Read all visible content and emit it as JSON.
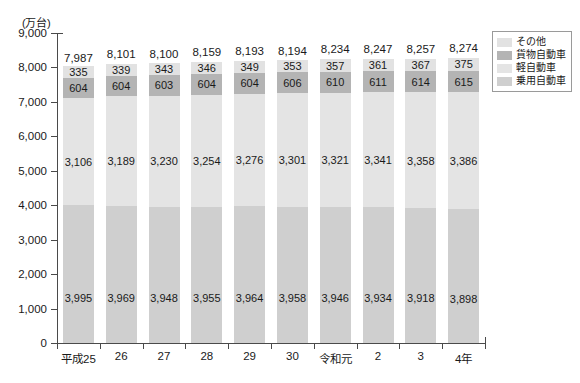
{
  "chart_data": {
    "type": "bar",
    "subtype": "stacked-bar",
    "title": "",
    "unit_label": "(万台)",
    "xlabel": "",
    "ylabel": "",
    "ylim": [
      0,
      9000
    ],
    "ytick_step": 1000,
    "ytick_labels": [
      "9,000",
      "8,000",
      "7,000",
      "6,000",
      "5,000",
      "4,000",
      "3,000",
      "2,000",
      "1,000",
      "0"
    ],
    "ytick_values": [
      9000,
      8000,
      7000,
      6000,
      5000,
      4000,
      3000,
      2000,
      1000,
      0
    ],
    "grid": false,
    "legend_position": "top-right",
    "categories": [
      "平成25",
      "26",
      "27",
      "28",
      "29",
      "30",
      "令和元",
      "2",
      "3",
      "4年"
    ],
    "series": [
      {
        "name": "乗用自動車",
        "color": "#cfcfcf",
        "values": [
          3995,
          3969,
          3948,
          3955,
          3964,
          3958,
          3946,
          3934,
          3918,
          3898
        ],
        "labels": [
          "3,995",
          "3,969",
          "3,948",
          "3,955",
          "3,964",
          "3,958",
          "3,946",
          "3,934",
          "3,918",
          "3,898"
        ]
      },
      {
        "name": "軽自動車",
        "color": "#e4e4e4",
        "values": [
          3106,
          3189,
          3230,
          3254,
          3276,
          3301,
          3321,
          3341,
          3358,
          3386
        ],
        "labels": [
          "3,106",
          "3,189",
          "3,230",
          "3,254",
          "3,276",
          "3,301",
          "3,321",
          "3,341",
          "3,358",
          "3,386"
        ]
      },
      {
        "name": "貨物自動車",
        "color": "#b4b4b4",
        "values": [
          604,
          604,
          603,
          604,
          604,
          606,
          610,
          611,
          614,
          615
        ],
        "labels": [
          "604",
          "604",
          "603",
          "604",
          "604",
          "606",
          "610",
          "611",
          "614",
          "615"
        ]
      },
      {
        "name": "その他",
        "color": "#e2e2e2",
        "values": [
          335,
          339,
          343,
          346,
          349,
          353,
          357,
          361,
          367,
          375
        ],
        "labels": [
          "335",
          "339",
          "343",
          "346",
          "349",
          "353",
          "357",
          "361",
          "367",
          "375"
        ]
      }
    ],
    "totals": [
      7987,
      8101,
      8100,
      8159,
      8193,
      8194,
      8234,
      8247,
      8257,
      8274
    ],
    "total_labels": [
      "7,987",
      "8,101",
      "8,100",
      "8,159",
      "8,193",
      "8,194",
      "8,234",
      "8,247",
      "8,257",
      "8,274"
    ]
  },
  "legend": {
    "items": [
      {
        "label": "その他",
        "color": "#e2e2e2"
      },
      {
        "label": "貨物自動車",
        "color": "#b4b4b4"
      },
      {
        "label": "軽自動車",
        "color": "#e4e4e4"
      },
      {
        "label": "乗用自動車",
        "color": "#cfcfcf"
      }
    ]
  },
  "colors": {
    "axis": "#4a4a4a",
    "text": "#1a1a1a",
    "background": "#ffffff"
  }
}
